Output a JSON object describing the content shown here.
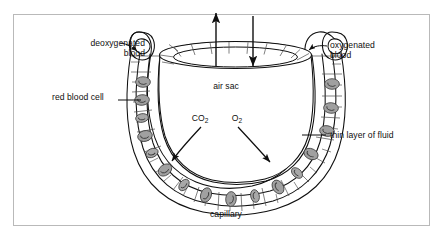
{
  "figure": {
    "background_color": "#ffffff",
    "frame_color": "#b9b9b9",
    "ink_color": "#0f0f0f",
    "cell_fill": "#a0a0a0",
    "cell_stroke": "#4a4a4a"
  },
  "labels": {
    "deoxygenated_blood_line1": "deoxygenated",
    "deoxygenated_blood_line2": "blood",
    "oxygenated_blood_line1": "oxygenated",
    "oxygenated_blood_line2": "blood",
    "red_blood_cell": "red blood cell",
    "thin_layer_of_fluid": "thin layer of fluid",
    "air_sac": "air sac",
    "capillary": "capillary",
    "carbon_dioxide": "CO",
    "carbon_dioxide_sub": "2",
    "oxygen": "O",
    "oxygen_sub": "2"
  },
  "diagram_data": {
    "type": "biological-cross-section",
    "structures": [
      {
        "name": "air-sac",
        "role": "alveolus lumen",
        "shape": "open cup with elliptical rim"
      },
      {
        "name": "alveolar-wall",
        "role": "segmented epithelial cell layer"
      },
      {
        "name": "thin-layer-of-fluid",
        "role": "moist lining between alveolus and capillary"
      },
      {
        "name": "capillary",
        "role": "horseshoe-shaped blood vessel around air sac"
      },
      {
        "name": "red-blood-cells",
        "role": "erythrocytes carrying gases",
        "count": 16
      }
    ],
    "airflow_arrows": [
      {
        "name": "air-out-arrow",
        "direction": "up",
        "meaning": "air leaving air sac"
      },
      {
        "name": "air-in-arrow",
        "direction": "down",
        "meaning": "air entering air sac"
      }
    ],
    "gas_exchange_arrows": [
      {
        "name": "co2-arrow",
        "gas": "CO2",
        "from": "red blood cell",
        "to": "air sac"
      },
      {
        "name": "o2-arrow",
        "gas": "O2",
        "from": "air sac",
        "to": "red blood cell"
      }
    ],
    "blood_flow": [
      {
        "name": "deoxygenated-inlet",
        "side": "left"
      },
      {
        "name": "oxygenated-outlet",
        "side": "right"
      }
    ]
  }
}
